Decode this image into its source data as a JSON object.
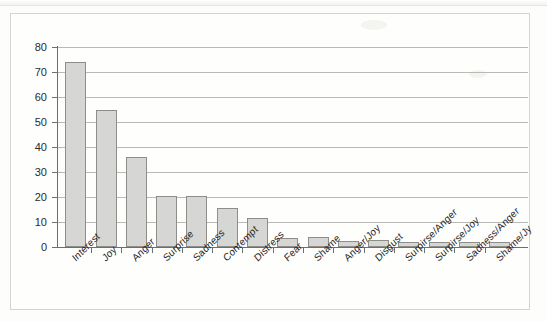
{
  "chart_data": {
    "type": "bar",
    "title": "",
    "subtitle": "",
    "xlabel": "",
    "ylabel": "",
    "ylim": [
      0,
      80
    ],
    "yticks": [
      0,
      10,
      20,
      30,
      40,
      50,
      60,
      70,
      80
    ],
    "grid": true,
    "legend": null,
    "legend_position": "none",
    "bar_fill_color": "#d6d6d4",
    "bar_edge_color": "#8d8d8a",
    "categories": [
      "Interest",
      "Joy",
      "Anger",
      "Surprise",
      "Sadness",
      "Contempt",
      "Distress",
      "Fear",
      "Shame",
      "Anger/Joy",
      "Disgust",
      "Surpirse/Anger",
      "Surpirse/Joy",
      "Sadness/Anger",
      "Shame/Jy"
    ],
    "values": [
      74,
      55,
      36,
      20.5,
      20.5,
      15.5,
      11.5,
      3.5,
      4,
      2.5,
      3,
      2,
      2,
      2,
      2
    ]
  },
  "axis": {
    "y_tick_labels": [
      "80",
      "70",
      "60",
      "50",
      "40",
      "30",
      "20",
      "10",
      "0"
    ]
  }
}
